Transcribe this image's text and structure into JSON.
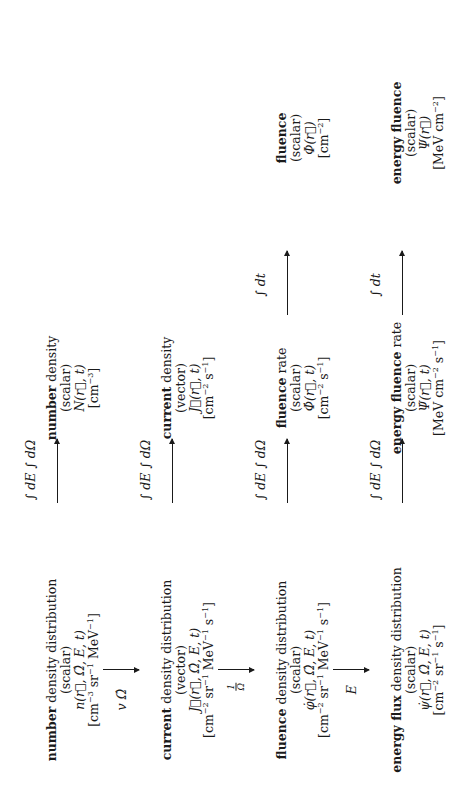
{
  "diagram": {
    "orientation": "rotated 90 degrees counter-clockwise",
    "rows": [
      {
        "distribution": {
          "bold": "number",
          "rest": " density distribution",
          "kind": "(scalar)",
          "symbol": "n(r⃗, Ω̂, E, t)",
          "unit_parts": [
            "[cm",
            "−3",
            " sr",
            "−1",
            " MeV",
            "−1",
            "]"
          ]
        },
        "integrate_label": "∫ dE ∫ dΩ",
        "integrated": {
          "bold": "number",
          "rest": " density",
          "kind": "(scalar)",
          "symbol": "N(r⃗, t)",
          "unit_parts": [
            "[cm",
            "−3",
            "]"
          ]
        }
      },
      {
        "distribution": {
          "bold": "current",
          "rest": " density distribution",
          "kind": "(vector)",
          "symbol": "J⃗(r⃗, Ω̂, E, t)",
          "unit_parts": [
            "[cm",
            "−2",
            " sr",
            "−1",
            " MeV",
            "−1",
            " s",
            "−1",
            "]"
          ]
        },
        "integrate_label": "∫ dE ∫ dΩ",
        "integrated": {
          "bold": "current",
          "rest": " density",
          "kind": "(vector)",
          "symbol": "J⃗(r⃗, t)",
          "unit_parts": [
            "[cm",
            "−2",
            " s",
            "−1",
            "]"
          ]
        }
      },
      {
        "distribution": {
          "bold": "fluence",
          "rest": " density distribution",
          "kind": "(scalar)",
          "symbol": "φ̇(r⃗, Ω̂, E, t)",
          "unit_parts": [
            "[cm",
            "−2",
            " sr",
            "−1",
            " MeV",
            "−1",
            " s",
            "−1",
            "]"
          ]
        },
        "integrate_label": "∫ dE ∫ dΩ",
        "integrated": {
          "bold": "fluence",
          "rest": " rate",
          "kind": "(scalar)",
          "symbol": "Φ̇(r⃗, t)",
          "unit_parts": [
            "[cm",
            "−2",
            " s",
            "−1",
            "]"
          ]
        },
        "time_label": "∫ dt",
        "final": {
          "bold": "fluence",
          "rest": "",
          "kind": "(scalar)",
          "symbol": "Φ(r⃗)",
          "unit_parts": [
            "[cm",
            "−2",
            "]"
          ]
        }
      },
      {
        "distribution": {
          "bold": "energy flux",
          "rest": " density distribution",
          "kind": "(scalar)",
          "symbol": "ψ̇(r⃗, Ω̂, E, t)",
          "unit_parts": [
            "[cm",
            "−2",
            " sr",
            "−1",
            " s",
            "−1",
            "]"
          ]
        },
        "integrate_label": "∫ dE ∫ dΩ",
        "integrated": {
          "bold": "energy fluence",
          "rest": " rate",
          "kind": "(scalar)",
          "symbol": "Ψ̇(r⃗, t)",
          "unit_parts": [
            "[MeV cm",
            "−2",
            " s",
            "−1",
            "]"
          ]
        },
        "time_label": "∫ dt",
        "final": {
          "bold": "energy fluence",
          "rest": "",
          "kind": "(scalar)",
          "symbol": "Ψ(r⃗)",
          "unit_parts": [
            "[MeV cm",
            "−2",
            "]"
          ]
        }
      }
    ],
    "vertical_arrows": [
      {
        "label": "v Ω̂"
      },
      {
        "label_num": "1",
        "label_den": "Ω"
      },
      {
        "label": "E"
      }
    ]
  }
}
